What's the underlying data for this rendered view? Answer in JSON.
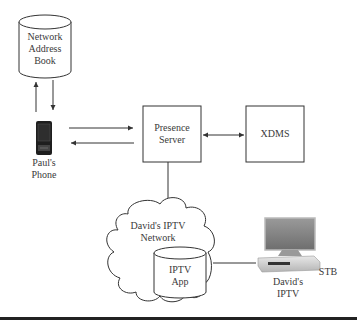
{
  "diagram": {
    "nodes": {
      "address_book": {
        "lines": [
          "Network",
          "Address",
          "Book"
        ],
        "shape": "cylinder"
      },
      "phone": {
        "lines": [
          "Paul's",
          "Phone"
        ],
        "shape": "phone-icon"
      },
      "presence_server": {
        "lines": [
          "Presence",
          "Server"
        ],
        "shape": "box"
      },
      "xdms": {
        "label": "XDMS",
        "shape": "box"
      },
      "iptv_network": {
        "lines": [
          "David's IPTV",
          "Network"
        ],
        "shape": "cloud"
      },
      "iptv_app": {
        "lines": [
          "IPTV",
          "App"
        ],
        "shape": "cylinder"
      },
      "stb": {
        "label": "STB",
        "shape": "tv-stb-icon"
      },
      "davids_iptv": {
        "lines": [
          "David's",
          "IPTV"
        ]
      }
    },
    "edges": [
      {
        "from": "phone",
        "to": "address_book",
        "arrow": "up"
      },
      {
        "from": "address_book",
        "to": "phone",
        "arrow": "down"
      },
      {
        "from": "phone",
        "to": "presence_server",
        "arrow": "right"
      },
      {
        "from": "presence_server",
        "to": "phone",
        "arrow": "left"
      },
      {
        "from": "presence_server",
        "to": "xdms",
        "arrow": "both"
      },
      {
        "from": "presence_server",
        "to": "iptv_network",
        "arrow": "none"
      },
      {
        "from": "iptv_app",
        "to": "stb",
        "arrow": "none"
      }
    ],
    "colors": {
      "line": "#333333",
      "text": "#3a3a3a",
      "phone_body": "#222222",
      "tv_screen": "#8a8a8a"
    }
  }
}
